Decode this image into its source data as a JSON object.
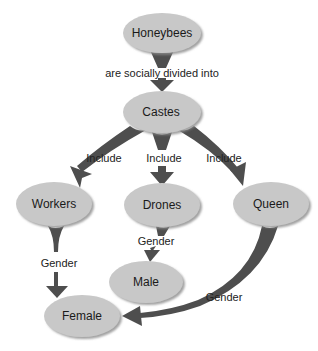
{
  "colors": {
    "node_fill": "#c8c8c8",
    "node_shadow": "#9a9a9a",
    "arrow": "#4e4e4e",
    "text": "#1a1a1a",
    "background": "#ffffff"
  },
  "nodes": {
    "honeybees": {
      "label": "Honeybees"
    },
    "castes": {
      "label": "Castes"
    },
    "workers": {
      "label": "Workers"
    },
    "drones": {
      "label": "Drones"
    },
    "queen": {
      "label": "Queen"
    },
    "male": {
      "label": "Male"
    },
    "female": {
      "label": "Female"
    }
  },
  "edges": {
    "honeybees_castes": {
      "label": "are socially divided into"
    },
    "castes_workers": {
      "label": "Include"
    },
    "castes_drones": {
      "label": "Include"
    },
    "castes_queen": {
      "label": "Include"
    },
    "workers_female": {
      "label": "Gender"
    },
    "drones_male": {
      "label": "Gender"
    },
    "queen_female": {
      "label": "Gender"
    }
  }
}
